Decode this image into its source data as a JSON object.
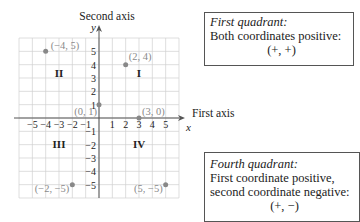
{
  "axes": {
    "second_axis_label": "Second axis",
    "y_symbol": "y",
    "first_axis_label": "First axis",
    "x_symbol": "x",
    "x_ticks": [
      "−5",
      "−4",
      "−3",
      "−2",
      "−1",
      "1",
      "2",
      "3",
      "4",
      "5"
    ],
    "y_ticks_pos": [
      "1",
      "2",
      "3",
      "4",
      "5"
    ],
    "y_ticks_neg": [
      "−1",
      "−2",
      "−3",
      "−4",
      "−5"
    ]
  },
  "quadrants": {
    "I": "I",
    "II": "II",
    "III": "III",
    "IV": "IV"
  },
  "points": [
    {
      "label": "(−4, 5)",
      "x": -4,
      "y": 5
    },
    {
      "label": "(2, 4)",
      "x": 2,
      "y": 4
    },
    {
      "label": "(0, 1)",
      "x": 0,
      "y": 1
    },
    {
      "label": "(3, 0)",
      "x": 3,
      "y": 0
    },
    {
      "label": "(−2, −5)",
      "x": -2,
      "y": -5
    },
    {
      "label": "(5, −5)",
      "x": 5,
      "y": -5
    }
  ],
  "callouts": {
    "first": {
      "title": "First quadrant:",
      "line1": "Both coordinates positive:",
      "sign": "(+, +)"
    },
    "fourth": {
      "title": "Fourth quadrant:",
      "line1": "First coordinate positive,",
      "line2": "second coordinate negative:",
      "sign": "(+, −)"
    }
  },
  "colors": {
    "grid": "#d0d0d0",
    "axis": "#555555",
    "point": "#888888",
    "point_label": "#8a8a8a"
  }
}
